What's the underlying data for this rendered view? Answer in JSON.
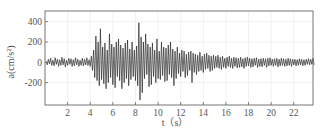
{
  "chart_data": {
    "type": "line",
    "title": "",
    "xlabel": "t（s）",
    "ylabel": "a(cm/s²)",
    "xlim": [
      0,
      23.7
    ],
    "ylim": [
      -420,
      505
    ],
    "grid": true,
    "legend": null,
    "x_ticks": [
      2,
      4,
      6,
      8,
      10,
      12,
      14,
      16,
      18,
      20,
      22
    ],
    "x_tick_labels": [
      "2",
      "4",
      "6",
      "8",
      "10",
      "12",
      "14",
      "16",
      "18",
      "20",
      "22"
    ],
    "y_ticks": [
      400,
      200,
      0,
      -200
    ],
    "y_tick_labels": [
      "400",
      "200",
      "0",
      "-200"
    ],
    "series": [
      {
        "name": "acceleration",
        "color": "#2a2a2a",
        "sample_interval_s": 0.1,
        "x_start": 0.1,
        "values": [
          10,
          -25,
          30,
          -15,
          40,
          -30,
          20,
          -35,
          45,
          -20,
          30,
          -40,
          25,
          -30,
          50,
          -25,
          35,
          -45,
          20,
          -30,
          40,
          -20,
          35,
          -40,
          25,
          -35,
          45,
          -25,
          30,
          -40,
          20,
          -30,
          40,
          -35,
          30,
          -25,
          45,
          -30,
          25,
          -40,
          60,
          -80,
          120,
          -150,
          260,
          -180,
          200,
          -230,
          330,
          -170,
          150,
          -210,
          190,
          -260,
          120,
          -200,
          280,
          -150,
          180,
          -220,
          150,
          -250,
          200,
          -140,
          230,
          -180,
          170,
          -260,
          140,
          -200,
          190,
          -160,
          220,
          -230,
          130,
          -170,
          200,
          -140,
          120,
          -180,
          160,
          -230,
          390,
          -370,
          250,
          -300,
          200,
          -160,
          280,
          -120,
          180,
          -240,
          150,
          -220,
          190,
          -140,
          120,
          -200,
          230,
          -160,
          110,
          -170,
          200,
          -130,
          150,
          -190,
          140,
          -180,
          170,
          -120,
          200,
          -150,
          130,
          -230,
          110,
          -160,
          150,
          -110,
          90,
          -140,
          120,
          -90,
          110,
          -150,
          80,
          -130,
          100,
          -80,
          110,
          -200,
          90,
          -100,
          80,
          -120,
          70,
          -90,
          100,
          -80,
          60,
          -100,
          80,
          -70,
          90,
          -60,
          70,
          -90,
          60,
          -80,
          70,
          -60,
          60,
          -50,
          70,
          -60,
          50,
          -70,
          60,
          -50,
          40,
          -60,
          50,
          -40,
          60,
          -50,
          40,
          -60,
          50,
          -40,
          45,
          -55,
          40,
          -50,
          50,
          -45,
          35,
          -60,
          45,
          -40,
          50,
          -35,
          40,
          -50,
          35,
          -45,
          40,
          -30,
          45,
          -50,
          30,
          -40,
          35,
          -45,
          40,
          -30,
          35,
          -50,
          40,
          -35,
          45,
          -30,
          30,
          -40,
          35,
          -30,
          40,
          -45,
          30,
          -35,
          40,
          -30,
          35,
          -40,
          30,
          -35,
          40,
          -30,
          35,
          -40,
          30,
          -25,
          30,
          -35,
          25,
          -30,
          35,
          -25,
          30,
          -35,
          25,
          -30,
          30,
          -20,
          35,
          -25,
          30,
          -20,
          40,
          -25
        ]
      }
    ]
  }
}
